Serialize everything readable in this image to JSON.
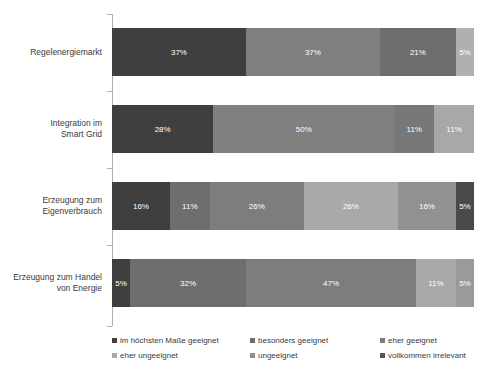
{
  "chart_data": {
    "type": "bar",
    "orientation": "horizontal",
    "stacked": true,
    "stack_mode": "percent",
    "title": "",
    "subtitle": "",
    "xlabel": "",
    "ylabel": "",
    "xlim": [
      0,
      100
    ],
    "grid": false,
    "legend_position": "bottom",
    "categories": [
      "Regelenergiemarkt",
      "Integration im\nSmart Grid",
      "Erzeugung zum\nEigenverbrauch",
      "Erzeugung zum Handel\nvon Energie"
    ],
    "series": [
      {
        "name": "im höchsten Maße geeignet",
        "color": "#3f3f3f",
        "values": [
          37,
          28,
          16,
          5
        ]
      },
      {
        "name": "besonders geeignet",
        "color": "#6e6e6e",
        "values": [
          0,
          0,
          11,
          32
        ]
      },
      {
        "name": "eher geeignet",
        "color": "#7d7d7d",
        "values": [
          37,
          50,
          26,
          0
        ]
      },
      {
        "name": "eher ungeeignet",
        "color": "#a9a9a9",
        "values": [
          0,
          0,
          26,
          47
        ]
      },
      {
        "name": "ungeeignet",
        "color": "#919191",
        "values": [
          21,
          11,
          16,
          11
        ]
      },
      {
        "name": "vollkommen irrelevant",
        "color": "#b3b3b3",
        "values": [
          5,
          11,
          5,
          5
        ]
      }
    ],
    "bars": [
      {
        "category": "Regelenergiemarkt",
        "segments": [
          {
            "series": "im höchsten Maße geeignet",
            "value": 37,
            "label": "37%",
            "color": "#3f3f3f"
          },
          {
            "series": "eher geeignet",
            "value": 37,
            "label": "37%",
            "color": "#808080"
          },
          {
            "series": "ungeeignet",
            "value": 21,
            "label": "21%",
            "color": "#6e6e6e"
          },
          {
            "series": "vollkommen irrelevant",
            "value": 5,
            "label": "5%",
            "color": "#b0b0b0"
          }
        ]
      },
      {
        "category": "Integration im\nSmart Grid",
        "segments": [
          {
            "series": "im höchsten Maße geeignet",
            "value": 28,
            "label": "28%",
            "color": "#3f3f3f"
          },
          {
            "series": "eher geeignet",
            "value": 50,
            "label": "50%",
            "color": "#808080"
          },
          {
            "series": "ungeeignet",
            "value": 11,
            "label": "11%",
            "color": "#787878"
          },
          {
            "series": "vollkommen irrelevant",
            "value": 11,
            "label": "11%",
            "color": "#a8a8a8"
          }
        ]
      },
      {
        "category": "Erzeugung zum\nEigenverbrauch",
        "segments": [
          {
            "series": "im höchsten Maße geeignet",
            "value": 16,
            "label": "16%",
            "color": "#3f3f3f"
          },
          {
            "series": "besonders geeignet",
            "value": 11,
            "label": "11%",
            "color": "#6e6e6e"
          },
          {
            "series": "eher geeignet",
            "value": 26,
            "label": "26%",
            "color": "#7d7d7d"
          },
          {
            "series": "eher ungeeignet",
            "value": 26,
            "label": "26%",
            "color": "#a9a9a9"
          },
          {
            "series": "ungeeignet",
            "value": 16,
            "label": "16%",
            "color": "#919191"
          },
          {
            "series": "vollkommen irrelevant",
            "value": 5,
            "label": "5%",
            "color": "#4a4a4a"
          }
        ]
      },
      {
        "category": "Erzeugung zum Handel\nvon Energie",
        "segments": [
          {
            "series": "im höchsten Maße geeignet",
            "value": 5,
            "label": "5%",
            "color": "#3f3f3f"
          },
          {
            "series": "besonders geeignet",
            "value": 32,
            "label": "32%",
            "color": "#6e6e6e"
          },
          {
            "series": "eher geeignet",
            "value": 47,
            "label": "47%",
            "color": "#7d7d7d"
          },
          {
            "series": "eher ungeeignet",
            "value": 11,
            "label": "11%",
            "color": "#a9a9a9"
          },
          {
            "series": "ungeeignet",
            "value": 5,
            "label": "5%",
            "color": "#9a9a9a"
          }
        ]
      }
    ]
  },
  "legend": {
    "items": [
      {
        "label": "im höchsten Maße geeignet",
        "color": "#3f3f3f"
      },
      {
        "label": "besonders geeignet",
        "color": "#6e6e6e"
      },
      {
        "label": "eher geeignet",
        "color": "#7d7d7d"
      },
      {
        "label": "eher ungeeignet",
        "color": "#a9a9a9"
      },
      {
        "label": "ungeeignet",
        "color": "#919191"
      },
      {
        "label": "vollkommen irrelevant",
        "color": "#555555"
      }
    ]
  },
  "style": {
    "axis_color": "#aeaeae",
    "background": "#ffffff",
    "label_color": "#3a3a3a",
    "value_label_color": "#ffffff"
  }
}
